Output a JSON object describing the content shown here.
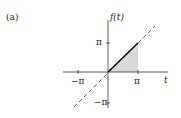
{
  "figure": {
    "panel_label": "(a)",
    "y_axis_label": "f(t)",
    "x_axis_label": "t",
    "x_ticks": [
      "−π",
      "π"
    ],
    "y_ticks": [
      "π",
      "−π"
    ],
    "colors": {
      "axis": "#333333",
      "line": "#111111",
      "shade": "#d9d9d9",
      "dashed": "#444444"
    }
  }
}
